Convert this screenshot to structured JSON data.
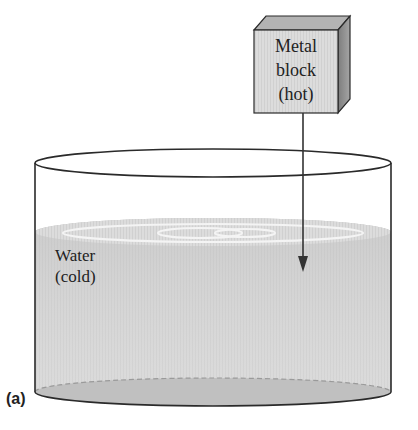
{
  "figure": {
    "panel_label": "(a)",
    "metal_block": {
      "line1": "Metal",
      "line2": "block",
      "line3": "(hot)"
    },
    "water": {
      "line1": "Water",
      "line2": "(cold)"
    },
    "colors": {
      "block_front": "#c8c8c8",
      "block_top": "#b5b5b5",
      "block_side": "#8f8f8f",
      "water": "#cdcdcd",
      "water_bottom": "#bdbdbd",
      "outline": "#2a2a2a",
      "ripple": "#f2f2f2"
    }
  }
}
